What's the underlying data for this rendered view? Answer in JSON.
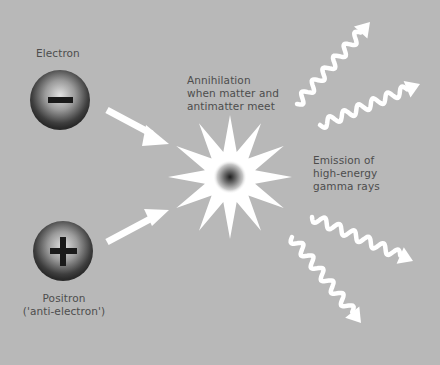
{
  "colors": {
    "background": "#b8b8b8",
    "label_text": "#4d4d4d",
    "arrow": "#ffffff",
    "particle_dark": "#2a2a2a",
    "particle_light": "#d8d8d8",
    "symbol": "#1a1a1a"
  },
  "electron": {
    "label": "Electron",
    "symbol": "minus-sign"
  },
  "positron": {
    "label_line1": "Positron",
    "label_line2": "('anti-electron')",
    "symbol": "plus-sign"
  },
  "annihilation": {
    "lines": [
      "Annihilation",
      "when matter and",
      "antimatter meet"
    ]
  },
  "emission": {
    "lines": [
      "Emission of",
      "high-energy",
      "gamma rays"
    ]
  }
}
